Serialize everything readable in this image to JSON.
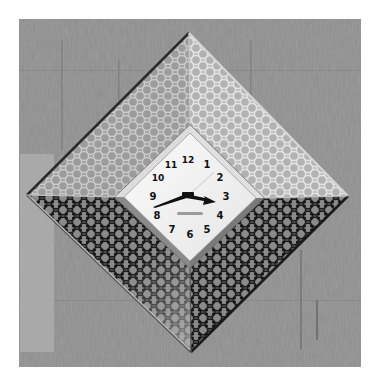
{
  "scene": {
    "subject": "Diamond-shaped wall clock with perforated metal frame on textured wall",
    "colors": {
      "page_background": "#ffffff",
      "wall": "#8c8c8c",
      "wall_streak": "#6f6f6f",
      "side_panel": "#a8a8a8",
      "frame_light": "#b4b4b4",
      "frame_mid": "#9a9a9a",
      "frame_dark": "#2a2a2a",
      "bezel": "#c8c8c8",
      "dial": "#f4f4f4",
      "hands": "#111111"
    }
  },
  "clock": {
    "numerals": [
      {
        "label": "12",
        "x": 188,
        "y": 160
      },
      {
        "label": "1",
        "x": 207,
        "y": 164
      },
      {
        "label": "2",
        "x": 220,
        "y": 177
      },
      {
        "label": "3",
        "x": 226,
        "y": 196
      },
      {
        "label": "4",
        "x": 220,
        "y": 215
      },
      {
        "label": "5",
        "x": 207,
        "y": 229
      },
      {
        "label": "6",
        "x": 190,
        "y": 234
      },
      {
        "label": "7",
        "x": 172,
        "y": 229
      },
      {
        "label": "8",
        "x": 157,
        "y": 215
      },
      {
        "label": "9",
        "x": 153,
        "y": 196
      },
      {
        "label": "10",
        "x": 158,
        "y": 178
      },
      {
        "label": "11",
        "x": 171,
        "y": 165
      }
    ],
    "time_shown": "about 3:40"
  }
}
